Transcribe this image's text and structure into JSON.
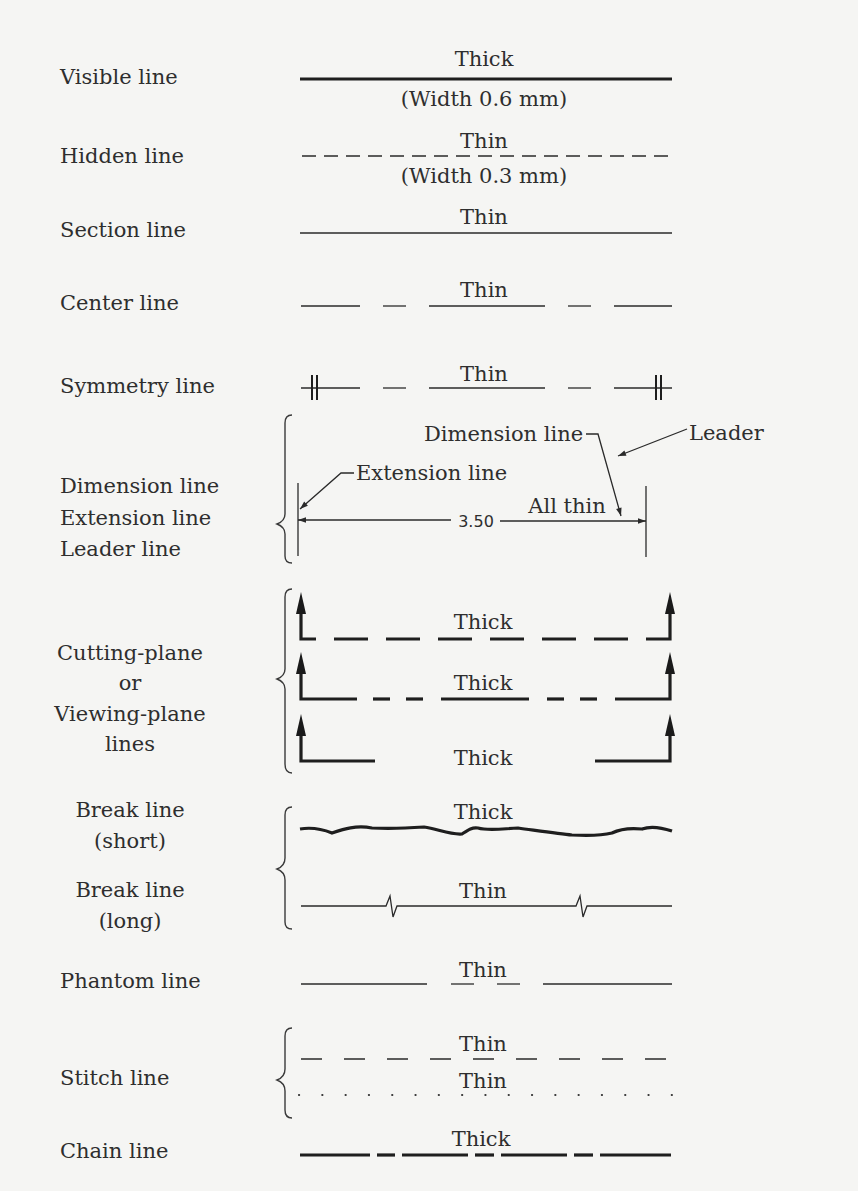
{
  "labels": {
    "visible": "Visible line",
    "hidden": "Hidden line",
    "section": "Section line",
    "center": "Center line",
    "symmetry": "Symmetry line",
    "dim_group": [
      "Dimension line",
      "Extension line",
      "Leader line"
    ],
    "cutting_group": [
      "Cutting-plane",
      "or",
      "Viewing-plane",
      "lines"
    ],
    "break_short": [
      "Break line",
      "(short)"
    ],
    "break_long": [
      "Break line",
      "(long)"
    ],
    "phantom": "Phantom line",
    "stitch": "Stitch line",
    "chain": "Chain line"
  },
  "captions": {
    "visible_top": "Thick",
    "visible_bottom": "(Width 0.6 mm)",
    "hidden_top": "Thin",
    "hidden_bottom": "(Width 0.3 mm)",
    "section": "Thin",
    "center": "Thin",
    "symmetry": "Thin",
    "dimension_callout": "Dimension line",
    "leader_callout": "Leader",
    "extension_callout": "Extension line",
    "all_thin": "All thin",
    "dimension_value": "3.50",
    "cutting_1": "Thick",
    "cutting_2": "Thick",
    "cutting_3": "Thick",
    "break_short": "Thick",
    "break_long": "Thin",
    "phantom": "Thin",
    "stitch_dash": "Thin",
    "stitch_dot": "Thin",
    "chain": "Thick"
  }
}
